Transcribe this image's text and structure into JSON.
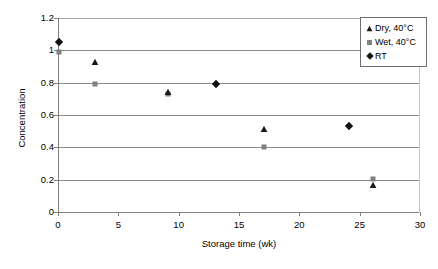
{
  "chart_data": {
    "type": "scatter",
    "title": "",
    "xlabel": "Storage time (wk)",
    "ylabel": "Concentration",
    "xlim": [
      0,
      30
    ],
    "ylim": [
      0,
      1.2
    ],
    "xticks": [
      "0",
      "5",
      "10",
      "15",
      "20",
      "25",
      "30"
    ],
    "xtick_values": [
      0,
      5,
      10,
      15,
      20,
      25,
      30
    ],
    "yticks": [
      "0",
      "0.2",
      "0.4",
      "0.6",
      "0.8",
      "1",
      "1.2"
    ],
    "ytick_values": [
      0,
      0.2,
      0.4,
      0.6,
      0.8,
      1,
      1.2
    ],
    "grid": "horizontal",
    "legend_position": "top-right",
    "series": [
      {
        "name": "Dry, 40°C",
        "marker": "triangle",
        "color": "#1a1a1a",
        "points": [
          {
            "x": 3,
            "y": 0.93
          },
          {
            "x": 9,
            "y": 0.745
          },
          {
            "x": 17,
            "y": 0.515
          },
          {
            "x": 26,
            "y": 0.17
          }
        ]
      },
      {
        "name": "Wet, 40°C",
        "marker": "square",
        "color": "#808080",
        "points": [
          {
            "x": 0,
            "y": 0.99
          },
          {
            "x": 3,
            "y": 0.79
          },
          {
            "x": 9,
            "y": 0.73
          },
          {
            "x": 17,
            "y": 0.405
          },
          {
            "x": 26,
            "y": 0.205
          }
        ]
      },
      {
        "name": "RT",
        "marker": "diamond",
        "color": "#111111",
        "points": [
          {
            "x": 0,
            "y": 1.05
          },
          {
            "x": 13,
            "y": 0.79
          },
          {
            "x": 24,
            "y": 0.53
          }
        ]
      }
    ]
  },
  "legend": {
    "items": [
      {
        "label": "Dry, 40°C",
        "marker": "triangle",
        "color": "#1a1a1a"
      },
      {
        "label": "Wet, 40°C",
        "marker": "square",
        "color": "#808080"
      },
      {
        "label": "RT",
        "marker": "diamond",
        "color": "#111111"
      }
    ]
  },
  "axes": {
    "x_title": "Storage time (wk)",
    "y_title": "Concentration"
  },
  "colors": {
    "gridline": "#8c8c8c",
    "axis": "#808080",
    "background": "#ffffff",
    "text": "#000000",
    "legend_border": "#6e6e6e"
  }
}
